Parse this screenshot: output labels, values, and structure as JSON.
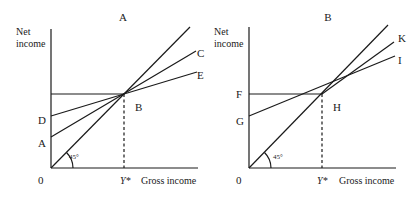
{
  "panels": [
    {
      "title": "A",
      "y_axis_label_line1": "Net",
      "y_axis_label_line2": "income",
      "x_axis_label": "Gross income",
      "origin_label": "0",
      "ystar_label": "Y*",
      "angle_label": "45°",
      "intersection_label": "B",
      "intercept_labels": [
        "D",
        "A"
      ],
      "line_end_labels": [
        "C",
        "E"
      ]
    },
    {
      "title": "B",
      "y_axis_label_line1": "Net",
      "y_axis_label_line2": "income",
      "x_axis_label": "Gross income",
      "origin_label": "0",
      "ystar_label": "Y*",
      "angle_label": "45°",
      "intersection_label": "H",
      "intercept_labels": [
        "F",
        "G"
      ],
      "line_end_labels": [
        "K",
        "I"
      ]
    }
  ]
}
